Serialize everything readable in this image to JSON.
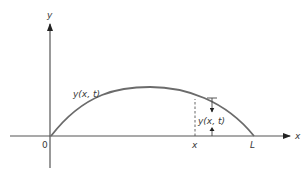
{
  "figure": {
    "type": "string-displacement-diagram",
    "axes": {
      "y_label": "y",
      "x_label": "x",
      "origin_label": "0"
    },
    "curve": {
      "label": "y(x, t)",
      "shape": "half-sine arch from 0 to L"
    },
    "markers": {
      "x_position_label": "x",
      "end_label": "L",
      "displacement_label": "y(x, t)"
    },
    "colors": {
      "axis": "#555555",
      "curve": "#6b6b6b",
      "text": "#3a3a3a",
      "background": "#ffffff"
    }
  }
}
